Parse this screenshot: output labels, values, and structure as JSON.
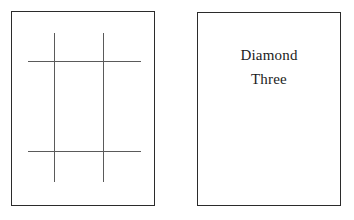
{
  "canvas": {
    "width": 354,
    "height": 220,
    "background_color": "#ffffff"
  },
  "panels": {
    "grid_panel": {
      "name": "pattern card",
      "border_color": "#2b2b2b",
      "fill_color": "#ffffff",
      "pattern": {
        "type": "hash-grid",
        "stroke_color": "#5a5a5a",
        "vertical_line_count": 2,
        "horizontal_line_count": 2,
        "cell_count": 9
      }
    },
    "label_panel": {
      "name": "label card",
      "border_color": "#2b2b2b",
      "fill_color": "#ffffff",
      "text_color": "#1c1c1c",
      "lines": [
        "Diamond",
        "Three"
      ]
    }
  }
}
